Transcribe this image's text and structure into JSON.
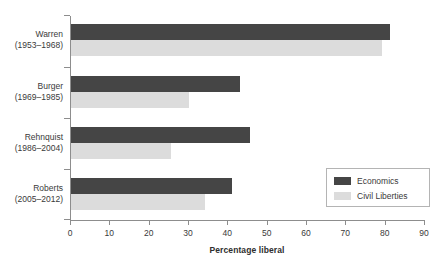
{
  "chart_data": {
    "type": "bar",
    "orientation": "horizontal",
    "title": "",
    "xlabel": "Percentage liberal",
    "ylabel": "",
    "xlim": [
      0,
      90
    ],
    "xticks": [
      0,
      10,
      20,
      30,
      40,
      50,
      60,
      70,
      80,
      90
    ],
    "grid": false,
    "legend_position": "bottom-right",
    "categories": [
      "Warren\n(1953–1968)",
      "Burger\n(1969–1985)",
      "Rehnquist\n(1986–2004)",
      "Roberts\n(2005–2012)"
    ],
    "category_parts": [
      {
        "name": "Warren",
        "years": "(1953–1968)"
      },
      {
        "name": "Burger",
        "years": "(1969–1985)"
      },
      {
        "name": "Rehnquist",
        "years": "(1986–2004)"
      },
      {
        "name": "Roberts",
        "years": "(2005–2012)"
      }
    ],
    "series": [
      {
        "name": "Economics",
        "color": "#454545",
        "values": [
          81,
          43,
          45.5,
          41
        ]
      },
      {
        "name": "Civil Liberties",
        "color": "#dcdcdc",
        "values": [
          79,
          30,
          25.5,
          34
        ]
      }
    ]
  },
  "axis": {
    "x_title": "Percentage liberal",
    "tick_labels": [
      "0",
      "10",
      "20",
      "30",
      "40",
      "50",
      "60",
      "70",
      "80",
      "90"
    ]
  },
  "legend": {
    "items": [
      {
        "label": "Economics"
      },
      {
        "label": "Civil Liberties"
      }
    ]
  },
  "colors": {
    "economics": "#454545",
    "civil_liberties": "#dcdcdc",
    "axis": "#8d8d8d",
    "text": "#3a3a3a",
    "legend_border": "#b4b4b4",
    "background": "#ffffff"
  }
}
